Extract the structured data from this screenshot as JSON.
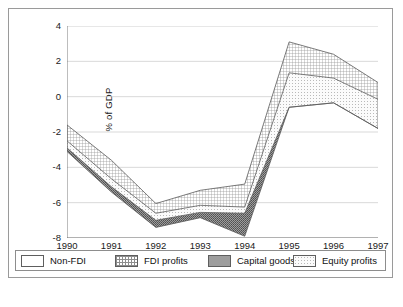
{
  "chart_data": {
    "type": "area",
    "title": "",
    "subtitle": "",
    "xlabel": "",
    "ylabel": "% of GDP",
    "categories": [
      "1990",
      "1991",
      "1992",
      "1993",
      "1994",
      "1995",
      "1996",
      "1997"
    ],
    "x": [
      1990,
      1991,
      1992,
      1993,
      1994,
      1995,
      1996,
      1997
    ],
    "xlim": [
      1990,
      1997
    ],
    "ylim": [
      -8,
      4
    ],
    "ytick_labels": [
      "4",
      "2",
      "0",
      "-2",
      "-4",
      "-6",
      "-8"
    ],
    "yticks": [
      4,
      2,
      0,
      -2,
      -4,
      -6,
      -8
    ],
    "grid": true,
    "legend_position": "bottom",
    "stacking": "cumulative-boundaries",
    "boundaries": {
      "fdi_profits_top": [
        -1.6,
        -3.6,
        -6.05,
        -5.3,
        -4.95,
        3.1,
        2.4,
        0.8
      ],
      "equity_profits_top": [
        -2.5,
        -4.65,
        -6.6,
        -6.15,
        -6.25,
        1.35,
        1.05,
        -0.15
      ],
      "capital_goods_bottom": [
        -2.9,
        -5.1,
        -7.0,
        -6.55,
        -6.6,
        -0.6,
        -0.35,
        -1.8
      ],
      "non_fdi_bottom": [
        -3.1,
        -5.4,
        -7.4,
        -6.85,
        -7.9,
        -0.6,
        -0.35,
        -1.8
      ]
    },
    "series": [
      {
        "name": "FDI profits",
        "pattern": "fine-cross-hatch",
        "color": "#b5b5b5",
        "upper": [
          -1.6,
          -3.6,
          -6.05,
          -5.3,
          -4.95,
          3.1,
          2.4,
          0.8
        ],
        "lower": [
          -2.5,
          -4.65,
          -6.6,
          -6.15,
          -6.25,
          1.35,
          1.05,
          -0.15
        ],
        "values": [
          0.9,
          1.05,
          0.55,
          0.85,
          1.3,
          1.75,
          1.35,
          0.95
        ]
      },
      {
        "name": "Equity profits",
        "pattern": "light-dotted",
        "color": "#d8d8d8",
        "upper": [
          -2.5,
          -4.65,
          -6.6,
          -6.15,
          -6.25,
          1.35,
          1.05,
          -0.15
        ],
        "lower": [
          -2.9,
          -5.1,
          -7.0,
          -6.55,
          -6.6,
          -0.6,
          -0.35,
          -1.8
        ],
        "values": [
          0.4,
          0.45,
          0.4,
          0.4,
          0.35,
          1.95,
          1.4,
          1.65
        ]
      },
      {
        "name": "Capital goods",
        "pattern": "dark-dense-dots",
        "color": "#8a8a8a",
        "upper": [
          -2.9,
          -5.1,
          -7.0,
          -6.55,
          -6.6,
          -0.6,
          -0.35,
          -1.8
        ],
        "lower": [
          -3.1,
          -5.4,
          -7.4,
          -6.85,
          -7.9,
          -0.6,
          -0.35,
          -1.8
        ],
        "values": [
          0.2,
          0.3,
          0.4,
          0.3,
          1.3,
          0.0,
          0.0,
          0.0
        ]
      },
      {
        "name": "Non-FDI",
        "pattern": "solid-white",
        "color": "#ffffff",
        "upper": [
          -3.1,
          -5.4,
          -7.4,
          -6.85,
          -7.9,
          -0.6,
          -0.35,
          -1.8
        ],
        "lower": [
          -3.1,
          -5.4,
          -7.4,
          -6.85,
          -7.9,
          -0.6,
          -0.35,
          -1.8
        ],
        "values": [
          0,
          0,
          0,
          0,
          0,
          0,
          0,
          0
        ]
      }
    ]
  },
  "axes": {
    "y_title": "% of GDP",
    "y_labels": [
      "4",
      "2",
      "0",
      "-2",
      "-4",
      "-6",
      "-8"
    ],
    "x_labels": [
      "1990",
      "1991",
      "1992",
      "1993",
      "1994",
      "1995",
      "1996",
      "1997"
    ]
  },
  "legend": {
    "items": [
      {
        "label": "Non-FDI",
        "swatch": "solid-white"
      },
      {
        "label": "FDI profits",
        "swatch": "fine-cross-hatch"
      },
      {
        "label": "Capital goods",
        "swatch": "dark-dense-dots"
      },
      {
        "label": "Equity profits",
        "swatch": "light-dotted"
      }
    ]
  },
  "caption": {
    "text": ""
  }
}
